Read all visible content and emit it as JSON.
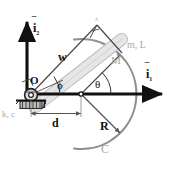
{
  "figure": {
    "type": "mechanical-schematic",
    "background_color": "#ffffff",
    "line_color": "#1a1a1a",
    "accent_gray": "#a8a8a8",
    "rod_gray": "#c9c9c9"
  },
  "labels": {
    "unit_vector_vertical": "i",
    "unit_vector_vertical_sub": "2",
    "unit_vector_horizontal": "i",
    "unit_vector_horizontal_sub": "1",
    "pivot": "O",
    "spring_damper": "k, c",
    "inertia": "I",
    "offset": "d",
    "rod_length_w": "w",
    "angle_phi": "ϕ",
    "angle_theta": "θ",
    "radius": "R",
    "curve": "C",
    "point_mass": "M",
    "rod_properties": "m, L",
    "apex_marker": "λ"
  },
  "geometry": {
    "pivot_O": [
      31,
      94
    ],
    "circle_center": [
      81,
      94
    ],
    "circle_radius": 55,
    "mass_M": [
      118,
      54
    ],
    "rod_angle_deg": -38,
    "theta_deg": 43,
    "phi_deg": 38,
    "horizontal_axis_y": 94,
    "vertical_axis_x": 27,
    "dimension_d_y": 114,
    "dimension_d_from_x": 31,
    "dimension_d_to_x": 81
  }
}
